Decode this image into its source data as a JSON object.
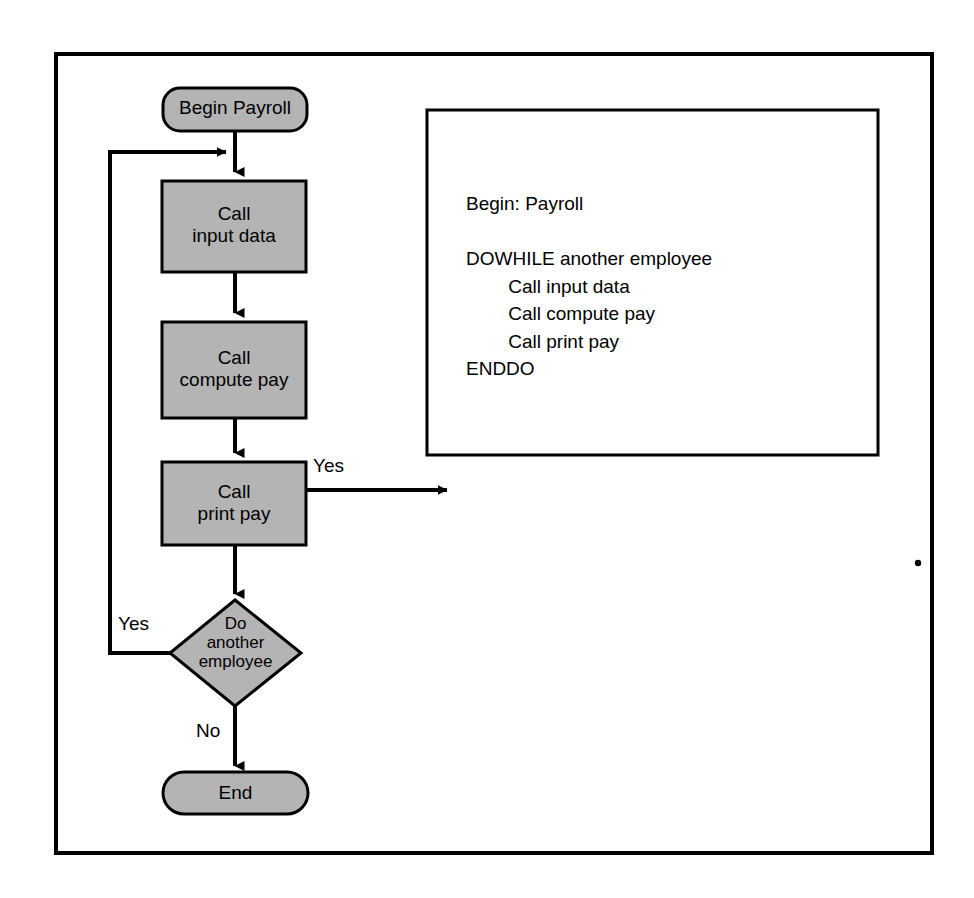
{
  "diagram": {
    "frame": {
      "border_color": "#000000",
      "fill": "#ffffff"
    },
    "style": {
      "process_fill": "#b4b4b4",
      "terminal_fill": "#b4b4b4",
      "decision_fill": "#b4b4b4",
      "stroke": "#000000",
      "text_color": "#000000"
    },
    "nodes": [
      {
        "id": "begin",
        "shape": "terminal",
        "label": "Begin Payroll"
      },
      {
        "id": "input",
        "shape": "process",
        "label": "Call\ninput data"
      },
      {
        "id": "compute",
        "shape": "process",
        "label": "Call\ncompute pay"
      },
      {
        "id": "print",
        "shape": "process",
        "label": "Call\nprint pay"
      },
      {
        "id": "decision",
        "shape": "decision",
        "label": "Do\nanother\nemployee"
      },
      {
        "id": "end",
        "shape": "terminal",
        "label": "End"
      }
    ],
    "edge_labels": {
      "loop_yes": "Yes",
      "print_yes": "Yes",
      "decision_no": "No"
    },
    "pseudocode": {
      "lines": [
        "Begin: Payroll",
        "",
        "DOWHILE another employee",
        "        Call input data",
        "        Call compute pay",
        "        Call print pay",
        "ENDDO"
      ],
      "text": "Begin: Payroll\n\nDOWHILE another employee\n        Call input data\n        Call compute pay\n        Call print pay\nENDDO"
    }
  }
}
